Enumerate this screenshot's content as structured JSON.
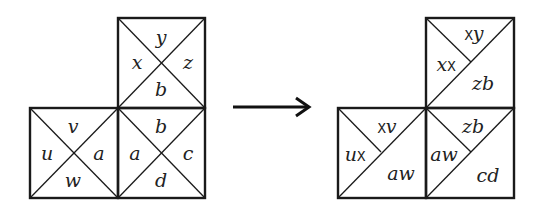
{
  "diagram": {
    "left": {
      "top_square": {
        "top": "y",
        "left": "x",
        "right": "z",
        "bottom": "b"
      },
      "bottom_left_square": {
        "top": "v",
        "left": "u",
        "right": "a",
        "bottom": "w"
      },
      "bottom_right_square": {
        "top": "b",
        "left": "a",
        "right": "c",
        "bottom": "d"
      }
    },
    "arrow": "right-arrow",
    "right": {
      "top_square": {
        "top": {
          "mono": "X",
          "ital": "y"
        },
        "left": {
          "ital": "x",
          "mono": "X"
        },
        "lower": "zb"
      },
      "bottom_left_square": {
        "top": {
          "mono": "X",
          "ital": "v"
        },
        "left": {
          "ital": "u",
          "mono": "X"
        },
        "lower": "aw"
      },
      "bottom_right_square": {
        "top": "zb",
        "left": "aw",
        "lower": "cd"
      }
    }
  }
}
